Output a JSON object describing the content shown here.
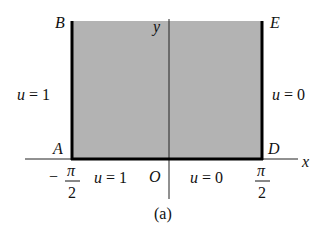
{
  "figure": {
    "caption": "(a)",
    "region": {
      "fill": "#b3b3b3",
      "description": "semi-infinite strip -π/2 < x < π/2, y > 0"
    },
    "points": {
      "A": "A",
      "B": "B",
      "D": "D",
      "E": "E",
      "O": "O"
    },
    "axes": {
      "x_label": "x",
      "y_label": "y"
    },
    "ticks": {
      "left": {
        "sign": "−",
        "numerator": "π",
        "denominator": "2"
      },
      "right": {
        "numerator": "π",
        "denominator": "2"
      }
    },
    "boundary_conditions": {
      "left_side": {
        "var": "u",
        "eq": " = 1"
      },
      "right_side": {
        "var": "u",
        "eq": " = 0"
      },
      "bottom_left": {
        "var": "u",
        "eq": " = 1"
      },
      "bottom_right": {
        "var": "u",
        "eq": " = 0"
      }
    }
  }
}
